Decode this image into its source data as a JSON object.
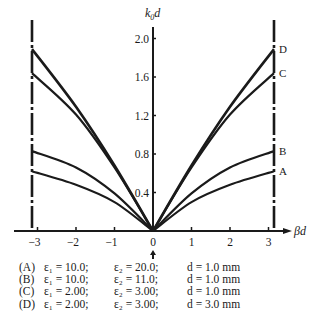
{
  "chart_data": {
    "type": "line",
    "title": "",
    "xlabel": "βd",
    "ylabel": "k0d",
    "xlim": [
      -3.3,
      3.4
    ],
    "ylim": [
      0,
      2.2
    ],
    "grid": false,
    "legend_position": "below",
    "x_ticks": [
      -3,
      -2,
      -1,
      0,
      1,
      2,
      3
    ],
    "x_tick_labels": [
      "−3",
      "−2",
      "−1",
      "0",
      "1",
      "2",
      "3"
    ],
    "y_ticks": [
      0.4,
      0.8,
      1.2,
      1.6,
      2.0
    ],
    "y_tick_labels": [
      "0.4",
      "0.8",
      "1.2",
      "1.6",
      "2.0"
    ],
    "boundaries": [
      -3.14159,
      3.14159
    ],
    "annotations": [
      "arrow at βd = 0",
      "dash-dot vertical lines at βd = ±π"
    ],
    "x": [
      -3.14159,
      -2,
      -1,
      0,
      1,
      2,
      3.14159
    ],
    "series": [
      {
        "name": "A",
        "label": "(A) ε1 = 10.0; ε2 = 20.0; d = 1.0 mm",
        "values": [
          0.62,
          0.48,
          0.3,
          0,
          0.3,
          0.48,
          0.62
        ]
      },
      {
        "name": "B",
        "label": "(B) ε1 = 10.0; ε2 = 11.0; d = 1.0 mm",
        "values": [
          0.83,
          0.66,
          0.39,
          0,
          0.39,
          0.66,
          0.83
        ]
      },
      {
        "name": "C",
        "label": "(C) ε1 = 2.00; ε2 = 3.00; d = 1.0 mm",
        "values": [
          1.64,
          1.21,
          0.66,
          0,
          0.66,
          1.21,
          1.64
        ]
      },
      {
        "name": "D",
        "label": "(D) ε1 = 2.00; ε2 = 3.00; d = 3.0 mm",
        "values": [
          1.89,
          1.29,
          0.68,
          0,
          0.68,
          1.29,
          1.89
        ]
      }
    ]
  },
  "axis": {
    "y_label": "k",
    "y_label_sub": "0",
    "y_label_tail": "d",
    "x_label": "βd"
  },
  "curve_labels": {
    "A": "A",
    "B": "B",
    "C": "C",
    "D": "D"
  },
  "legend": [
    {
      "key": "(A)",
      "e1": "ε₁ = 10.0;",
      "e2": "ε₂ = 20.0;",
      "d": "d = 1.0 mm"
    },
    {
      "key": "(B)",
      "e1": "ε₁ = 10.0;",
      "e2": "ε₂ = 11.0;",
      "d": "d = 1.0 mm"
    },
    {
      "key": "(C)",
      "e1": "ε₁ = 2.00;",
      "e2": "ε₂ = 3.00;",
      "d": "d = 1.0 mm"
    },
    {
      "key": "(D)",
      "e1": "ε₁ = 2.00;",
      "e2": "ε₂ = 3.00;",
      "d": "d = 3.0 mm"
    }
  ]
}
